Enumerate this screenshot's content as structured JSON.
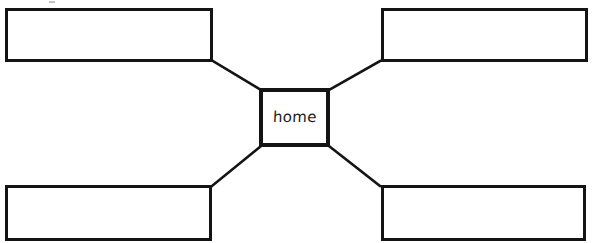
{
  "worksheet": {
    "type": "spider-diagram-graphic-organizer",
    "width": 599,
    "height": 243,
    "background_color": "#ffffff",
    "ink_color": "#141414"
  },
  "center_node": {
    "label": "home",
    "name": "center-topic-box"
  },
  "outer_nodes": [
    {
      "position": "top-left",
      "label": ""
    },
    {
      "position": "top-right",
      "label": ""
    },
    {
      "position": "bottom-left",
      "label": ""
    },
    {
      "position": "bottom-right",
      "label": ""
    }
  ],
  "connectors": [
    {
      "from": "center-box",
      "to": "top-left-box"
    },
    {
      "from": "center-box",
      "to": "top-right-box"
    },
    {
      "from": "center-box",
      "to": "bottom-left-box"
    },
    {
      "from": "center-box",
      "to": "bottom-right-box"
    }
  ]
}
